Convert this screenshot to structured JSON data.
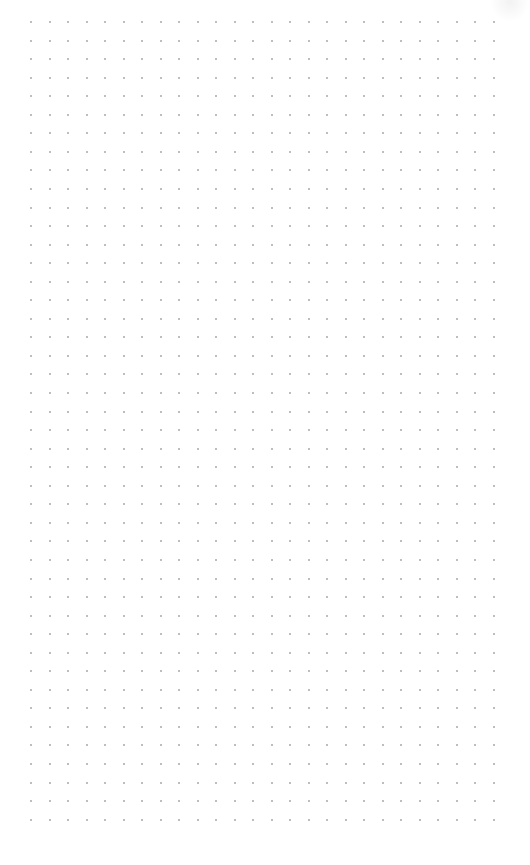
{
  "canvas": {
    "type": "dot-grid",
    "background": "#ffffff",
    "dot_color": "#a8a8a8",
    "dot_size": 2,
    "origin_x": 31,
    "origin_y": 22,
    "spacing_x": 18.5,
    "spacing_y": 18.55,
    "columns": 26,
    "rows": 44
  }
}
